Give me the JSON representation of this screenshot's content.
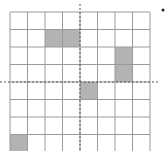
{
  "diagram": {
    "type": "grid",
    "rows": 8,
    "cols": 8,
    "origin": {
      "x": 10,
      "y": 12
    },
    "cell_size": 17.5,
    "grid_line_color": "#9a9a9a",
    "fill_color": "#b3b3b3",
    "axis_color": "#555555",
    "axes": {
      "vertical_dashed_col": 4,
      "horizontal_dashed_row": 4
    },
    "shaded_cells": [
      {
        "row": 1,
        "col": 2
      },
      {
        "row": 1,
        "col": 3
      },
      {
        "row": 2,
        "col": 6
      },
      {
        "row": 3,
        "col": 6
      },
      {
        "row": 4,
        "col": 4
      },
      {
        "row": 7,
        "col": 0
      }
    ],
    "marker": {
      "x": 163,
      "y": 10,
      "color": "#222222"
    }
  }
}
